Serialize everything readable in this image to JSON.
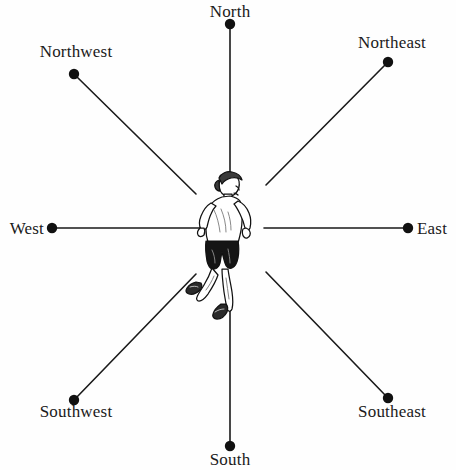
{
  "figure": {
    "background_color": "#fefefe",
    "line_color": "#1a1a1a",
    "dot_color": "#111111",
    "text_color": "#1a1a1a",
    "center_figure": "running-person-illustration"
  },
  "directions": [
    {
      "key": "north",
      "label": "North",
      "dot_x": 230,
      "dot_y": 24,
      "line_inner_x": 230,
      "line_inner_y": 172,
      "angle_deg": 90
    },
    {
      "key": "northeast",
      "label": "Northeast",
      "dot_x": 388,
      "dot_y": 62,
      "line_inner_x": 266,
      "line_inner_y": 185,
      "angle_deg": 45
    },
    {
      "key": "east",
      "label": "East",
      "dot_x": 408,
      "dot_y": 228,
      "line_inner_x": 264,
      "line_inner_y": 228,
      "angle_deg": 0
    },
    {
      "key": "southeast",
      "label": "Southeast",
      "dot_x": 388,
      "dot_y": 398,
      "line_inner_x": 266,
      "line_inner_y": 272,
      "angle_deg": 315
    },
    {
      "key": "south",
      "label": "South",
      "dot_x": 230,
      "dot_y": 446,
      "line_inner_x": 230,
      "line_inner_y": 297,
      "angle_deg": 270
    },
    {
      "key": "southwest",
      "label": "Southwest",
      "dot_x": 74,
      "dot_y": 400,
      "line_inner_x": 196,
      "line_inner_y": 274,
      "angle_deg": 225
    },
    {
      "key": "west",
      "label": "West",
      "dot_x": 52,
      "dot_y": 228,
      "line_inner_x": 200,
      "line_inner_y": 228,
      "angle_deg": 180
    },
    {
      "key": "northwest",
      "label": "Northwest",
      "dot_x": 74,
      "dot_y": 74,
      "line_inner_x": 196,
      "line_inner_y": 194,
      "angle_deg": 135
    }
  ],
  "runner": {
    "name": "runner-illustration",
    "description": "Line drawing of a person running, facing right",
    "shirt_color": "#ffffff",
    "shorts_color": "#151515",
    "outline_color": "#111111",
    "shoe_color": "#222222"
  }
}
